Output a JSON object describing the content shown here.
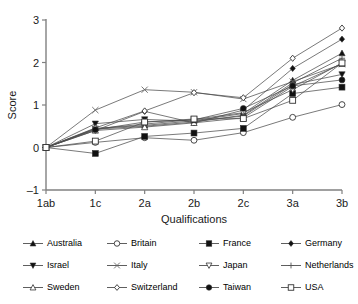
{
  "chart_data": {
    "type": "line",
    "title": "",
    "xlabel": "Qualifications",
    "ylabel": "Score",
    "categories": [
      "1ab",
      "1c",
      "2a",
      "2b",
      "2c",
      "3a",
      "3b"
    ],
    "yticks": [
      -1,
      0,
      1,
      2,
      3
    ],
    "ylim": [
      -1,
      3
    ],
    "grid": false,
    "legend_position": "bottom",
    "series": [
      {
        "name": "Australia",
        "marker": "triangle-up-filled",
        "values": [
          0.0,
          0.45,
          0.52,
          0.63,
          0.8,
          1.58,
          2.22
        ]
      },
      {
        "name": "Britain",
        "marker": "circle-open",
        "values": [
          0.0,
          0.12,
          0.23,
          0.17,
          0.35,
          0.71,
          1.01
        ]
      },
      {
        "name": "France",
        "marker": "square-filled",
        "values": [
          0.0,
          -0.14,
          0.26,
          0.34,
          0.45,
          1.27,
          1.42
        ]
      },
      {
        "name": "Germany",
        "marker": "diamond-filled",
        "values": [
          0.0,
          0.4,
          0.85,
          0.58,
          0.88,
          1.86,
          2.55
        ]
      },
      {
        "name": "Israel",
        "marker": "triangle-down-filled",
        "values": [
          0.0,
          0.56,
          0.66,
          0.62,
          0.74,
          1.48,
          1.72
        ]
      },
      {
        "name": "Italy",
        "marker": "cross-x",
        "values": [
          0.0,
          0.88,
          1.36,
          1.3,
          1.14,
          1.55,
          1.96
        ]
      },
      {
        "name": "Japan",
        "marker": "triangle-down-open",
        "values": [
          0.0,
          0.44,
          0.55,
          0.66,
          0.82,
          1.36,
          1.99
        ]
      },
      {
        "name": "Netherlands",
        "marker": "plus",
        "values": [
          0.0,
          0.43,
          0.5,
          0.6,
          0.76,
          1.52,
          2.1
        ]
      },
      {
        "name": "Sweden",
        "marker": "triangle-up-open",
        "values": [
          0.0,
          0.4,
          0.48,
          0.58,
          0.7,
          1.44,
          1.97
        ]
      },
      {
        "name": "Switzerland",
        "marker": "diamond-open",
        "values": [
          0.0,
          0.46,
          0.86,
          1.29,
          1.17,
          2.1,
          2.81
        ]
      },
      {
        "name": "Taiwan",
        "marker": "circle-filled",
        "values": [
          0.0,
          0.42,
          0.6,
          0.65,
          0.92,
          1.45,
          1.59
        ]
      },
      {
        "name": "USA",
        "marker": "square-open",
        "values": [
          0.0,
          0.15,
          0.6,
          0.67,
          0.68,
          1.11,
          1.99
        ]
      }
    ]
  },
  "axis": {
    "y_label": "Score",
    "x_label": "Qualifications",
    "x_tick_labels": [
      "1ab",
      "1c",
      "2a",
      "2b",
      "2c",
      "3a",
      "3b"
    ],
    "y_tick_labels": [
      "3",
      "2",
      "1",
      "0",
      "-1"
    ]
  },
  "legend": {
    "entries": [
      {
        "label": "Australia"
      },
      {
        "label": "Britain"
      },
      {
        "label": "France"
      },
      {
        "label": "Germany"
      },
      {
        "label": "Israel"
      },
      {
        "label": "Italy"
      },
      {
        "label": "Japan"
      },
      {
        "label": "Netherlands"
      },
      {
        "label": "Sweden"
      },
      {
        "label": "Switzerland"
      },
      {
        "label": "Taiwan"
      },
      {
        "label": "USA"
      }
    ]
  },
  "colors": {
    "line": "#4d4d4d",
    "axis": "#808080",
    "text": "#1a1a1a"
  }
}
